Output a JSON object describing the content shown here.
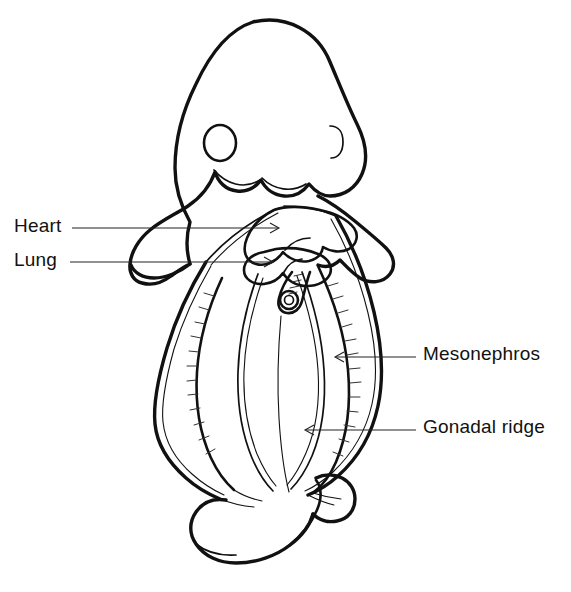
{
  "figure": {
    "background_color": "#ffffff",
    "ink_color": "#111111",
    "width": 571,
    "height": 592
  },
  "labels": [
    {
      "id": "heart",
      "text": "Heart",
      "side": "left",
      "leader_from": [
        72,
        228
      ],
      "leader_to": [
        278,
        228
      ],
      "arrow_direction": "right"
    },
    {
      "id": "lung",
      "text": "Lung",
      "side": "left",
      "leader_from": [
        70,
        262
      ],
      "leader_to": [
        272,
        262
      ],
      "arrow_direction": "right"
    },
    {
      "id": "mesonephros",
      "text": "Mesonephros",
      "side": "right",
      "leader_from": [
        416,
        357
      ],
      "leader_to": [
        336,
        357
      ],
      "arrow_direction": "left"
    },
    {
      "id": "gonadal-ridge",
      "text": "Gonadal ridge",
      "side": "right",
      "leader_from": [
        416,
        430
      ],
      "leader_to": [
        306,
        430
      ],
      "arrow_direction": "left"
    }
  ],
  "structures": [
    {
      "id": "head",
      "name": "head"
    },
    {
      "id": "eye",
      "name": "eye"
    },
    {
      "id": "otic-vesicle",
      "name": "otic-vesicle"
    },
    {
      "id": "forelimb-bud-left",
      "name": "forelimb-bud-left"
    },
    {
      "id": "forelimb-bud-right",
      "name": "forelimb-bud-right"
    },
    {
      "id": "heart",
      "name": "heart"
    },
    {
      "id": "lung-buds",
      "name": "lung-buds"
    },
    {
      "id": "umbilical-stump",
      "name": "umbilical-stump"
    },
    {
      "id": "body-wall",
      "name": "body-wall"
    },
    {
      "id": "mesonephros-ridge-left",
      "name": "mesonephros-ridge-left"
    },
    {
      "id": "mesonephros-ridge-right",
      "name": "mesonephros-ridge-right"
    },
    {
      "id": "gonadal-ridge-left",
      "name": "gonadal-ridge-left"
    },
    {
      "id": "gonadal-ridge-right",
      "name": "gonadal-ridge-right"
    },
    {
      "id": "hindlimb-bud",
      "name": "hindlimb-bud"
    },
    {
      "id": "tail",
      "name": "tail"
    }
  ]
}
